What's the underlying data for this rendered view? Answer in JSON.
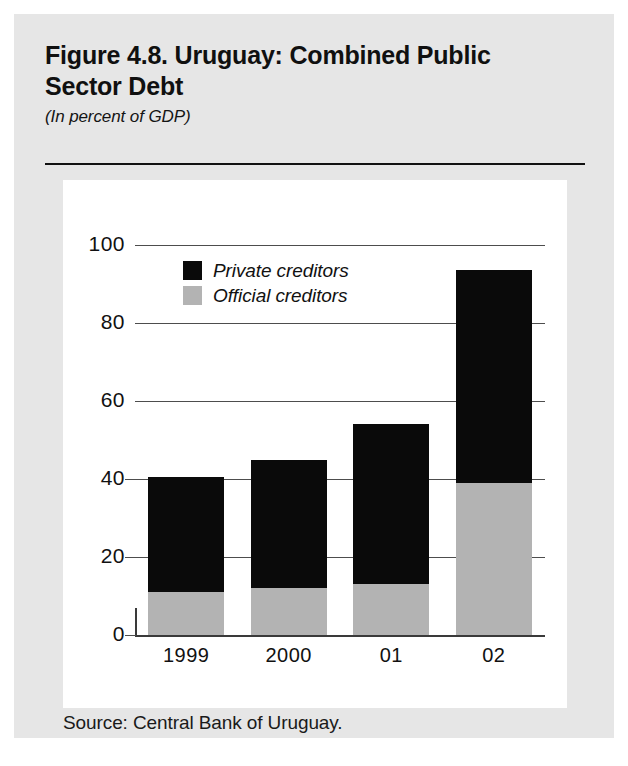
{
  "figure": {
    "title": "Figure 4.8. Uruguay: Combined Public Sector Debt",
    "subtitle": "(In percent of GDP)",
    "source": "Source: Central Bank of Uruguay."
  },
  "colors": {
    "private": "#0a0a0a",
    "official": "#b3b3b3",
    "page_background": "#e6e6e6",
    "panel_background": "#ffffff",
    "gridline": "#4d4d4d"
  },
  "chart_data": {
    "type": "bar",
    "stacked": true,
    "title": "Figure 4.8. Uruguay: Combined Public Sector Debt",
    "subtitle": "(In percent of GDP)",
    "xlabel": "",
    "ylabel": "",
    "categories": [
      "1999",
      "2000",
      "01",
      "02"
    ],
    "ylim": [
      0,
      100
    ],
    "yticks": [
      0,
      20,
      40,
      60,
      80,
      100
    ],
    "ytick_labels": [
      "0",
      "20",
      "40",
      "60",
      "80",
      "100"
    ],
    "grid": "horizontal",
    "legend_position": "top-left-inside",
    "series": [
      {
        "name": "Official creditors",
        "color": "#b3b3b3",
        "values": [
          11,
          12,
          13,
          39
        ]
      },
      {
        "name": "Private creditors",
        "color": "#0a0a0a",
        "values": [
          29.5,
          33,
          41,
          54.5
        ]
      }
    ],
    "totals": [
      40.5,
      45,
      54,
      93.5
    ],
    "legend": [
      "Private creditors",
      "Official creditors"
    ]
  }
}
